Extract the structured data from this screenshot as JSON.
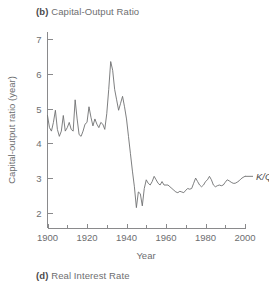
{
  "panel": {
    "tag": "(b)",
    "title": "Capital-Output Ratio",
    "caption_tag": "(d)",
    "caption_title": "Real Interest Rate"
  },
  "chart_data": {
    "type": "line",
    "title": "(b) Capital-Output Ratio",
    "xlabel": "Year",
    "ylabel": "Capital-output ratio (year)",
    "xlim": [
      1900,
      2000
    ],
    "ylim": [
      1.55,
      7.2
    ],
    "grid": false,
    "legend_position": "right-inline",
    "x_ticks_major": [
      1900,
      1920,
      1940,
      1960,
      1980,
      2000
    ],
    "x_ticks_minor": [
      1910,
      1930,
      1950,
      1970,
      1990
    ],
    "x_tick_labels": [
      "1900",
      "1920",
      "1940",
      "1960",
      "1980",
      "2000"
    ],
    "y_ticks": [
      2,
      3,
      4,
      5,
      6,
      7
    ],
    "y_tick_labels": [
      "2",
      "3",
      "4",
      "5",
      "6",
      "7"
    ],
    "line_color": "#6f7072",
    "axis_color": "#8a8a8c",
    "series": [
      {
        "name": "K/Q",
        "label": "K/Q",
        "x": [
          1900,
          1901,
          1902,
          1903,
          1904,
          1905,
          1906,
          1907,
          1908,
          1909,
          1910,
          1911,
          1912,
          1913,
          1914,
          1915,
          1916,
          1917,
          1918,
          1919,
          1920,
          1921,
          1922,
          1923,
          1924,
          1925,
          1926,
          1927,
          1928,
          1929,
          1930,
          1931,
          1932,
          1933,
          1934,
          1935,
          1936,
          1937,
          1938,
          1939,
          1940,
          1941,
          1942,
          1943,
          1944,
          1945,
          1946,
          1947,
          1948,
          1949,
          1950,
          1951,
          1952,
          1953,
          1954,
          1955,
          1956,
          1957,
          1958,
          1959,
          1960,
          1961,
          1962,
          1963,
          1964,
          1965,
          1966,
          1967,
          1968,
          1969,
          1970,
          1971,
          1972,
          1973,
          1974,
          1975,
          1976,
          1977,
          1978,
          1979,
          1980,
          1981,
          1982,
          1983,
          1984,
          1985,
          1986,
          1987,
          1988,
          1989,
          1990,
          1991,
          1992,
          1993,
          1994,
          1995,
          1996,
          1997,
          1998,
          1999,
          2000
        ],
        "values": [
          4.8,
          4.45,
          4.35,
          4.6,
          4.95,
          4.4,
          4.2,
          4.35,
          4.8,
          4.35,
          4.45,
          4.6,
          4.4,
          4.35,
          5.25,
          4.7,
          4.25,
          4.2,
          4.35,
          4.55,
          4.6,
          5.05,
          4.75,
          4.5,
          4.7,
          4.55,
          4.45,
          4.6,
          4.55,
          4.4,
          4.85,
          5.55,
          6.35,
          6.1,
          5.55,
          5.25,
          4.95,
          5.15,
          5.35,
          5.05,
          4.7,
          4.2,
          3.7,
          3.2,
          2.75,
          2.15,
          2.6,
          2.55,
          2.2,
          2.7,
          2.95,
          2.85,
          2.8,
          2.9,
          3.05,
          2.95,
          2.85,
          2.8,
          2.9,
          2.8,
          2.8,
          2.8,
          2.75,
          2.7,
          2.65,
          2.6,
          2.58,
          2.62,
          2.6,
          2.58,
          2.65,
          2.7,
          2.68,
          2.7,
          2.85,
          3.0,
          2.9,
          2.8,
          2.75,
          2.8,
          2.9,
          2.95,
          3.05,
          2.95,
          2.8,
          2.75,
          2.78,
          2.8,
          2.78,
          2.8,
          2.88,
          2.95,
          2.92,
          2.88,
          2.85,
          2.85,
          2.88,
          2.92,
          2.98,
          3.02,
          3.05
        ]
      }
    ]
  }
}
